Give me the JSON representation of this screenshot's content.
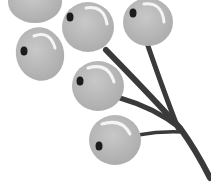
{
  "image": {
    "subject": "berry-branch-illustration",
    "description": "Grayscale illustration of six round berries on a dark branching stem",
    "colors": {
      "background": "#ffffff",
      "berry_fill": "#bdbdbd",
      "berry_edge": "#a8a8a8",
      "highlight": "#f4f4f4",
      "dot": "#1c1c1c",
      "stem": "#3a3a3a"
    },
    "berry_count": 6
  }
}
